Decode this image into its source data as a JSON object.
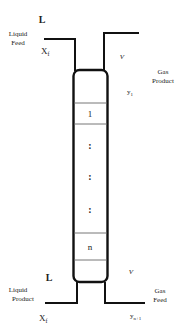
{
  "diagram": {
    "type": "absorption-column",
    "top_left": {
      "flow_symbol": "L",
      "stream_name_line1": "Liquid",
      "stream_name_line2": "Feed",
      "composition_main": "X",
      "composition_sub": "f"
    },
    "top_right": {
      "flow_symbol": "V",
      "stream_name_line1": "Gas",
      "stream_name_line2": "Product",
      "composition_main": "y",
      "composition_sub": "1"
    },
    "bottom_left": {
      "flow_symbol": "L",
      "stream_name_line1": "Liquid",
      "stream_name_line2": "Product",
      "composition_main": "X",
      "composition_sub": "f"
    },
    "bottom_right": {
      "flow_symbol": "V",
      "stream_name_line1": "Gas",
      "stream_name_line2": "Feed",
      "composition_main": "y",
      "composition_sub": "n+1"
    },
    "stages": {
      "first": "1",
      "last": "n",
      "ellipsis": ":"
    }
  }
}
